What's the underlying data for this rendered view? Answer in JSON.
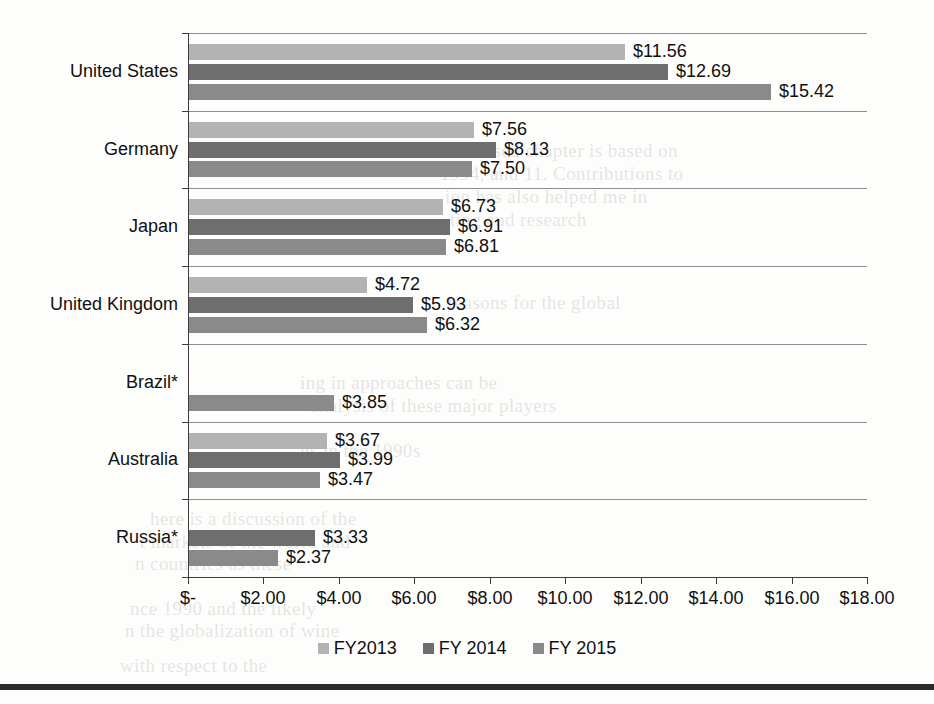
{
  "chart_data": {
    "type": "bar",
    "orientation": "horizontal",
    "title": "",
    "xlabel": "",
    "ylabel": "",
    "xlim": [
      0,
      18
    ],
    "xticks": [
      0,
      2,
      4,
      6,
      8,
      10,
      12,
      14,
      16,
      18
    ],
    "xtick_labels": [
      "$-",
      "$2.00",
      "$4.00",
      "$6.00",
      "$8.00",
      "$10.00",
      "$12.00",
      "$14.00",
      "$16.00",
      "$18.00"
    ],
    "grid": "horizontal-category-separators",
    "legend_position": "bottom-center",
    "categories": [
      "United States",
      "Germany",
      "Japan",
      "United Kingdom",
      "Brazil*",
      "Australia",
      "Russia*"
    ],
    "series": [
      {
        "name": "FY2013",
        "color": "#b3b3b3",
        "values": [
          11.56,
          7.56,
          6.73,
          4.72,
          null,
          3.67,
          null
        ],
        "labels": [
          "$11.56",
          "$7.56",
          "$6.73",
          "$4.72",
          "",
          "$3.67",
          ""
        ]
      },
      {
        "name": "FY 2014",
        "color": "#6e6e6e",
        "values": [
          12.69,
          8.13,
          6.91,
          5.93,
          null,
          3.99,
          3.33
        ],
        "labels": [
          "$12.69",
          "$8.13",
          "$6.91",
          "$5.93",
          "",
          "$3.99",
          "$3.33"
        ]
      },
      {
        "name": "FY 2015",
        "color": "#8a8a8a",
        "values": [
          15.42,
          7.5,
          6.81,
          6.32,
          3.85,
          3.47,
          2.37
        ],
        "labels": [
          "$15.42",
          "$7.50",
          "$6.81",
          "$6.32",
          "$3.85",
          "$3.47",
          "$2.37"
        ]
      }
    ]
  },
  "legend": {
    "items": [
      {
        "label": "FY2013",
        "color": "#b3b3b3"
      },
      {
        "label": "FY 2014",
        "color": "#6e6e6e"
      },
      {
        "label": "FY 2015",
        "color": "#8a8a8a"
      }
    ]
  },
  "background_text": [
    {
      "text": "is used chapter is based on",
      "x": 465,
      "y": 140
    },
    {
      "text": "1994, and 11. Contributions to",
      "x": 440,
      "y": 163
    },
    {
      "text": "ion has also helped me in",
      "x": 445,
      "y": 186
    },
    {
      "text": "ting and research",
      "x": 450,
      "y": 209
    },
    {
      "text": "reasons for the global",
      "x": 448,
      "y": 292
    },
    {
      "text": "ing in approaches can be",
      "x": 300,
      "y": 372
    },
    {
      "text": "analysis of these major players",
      "x": 310,
      "y": 395
    },
    {
      "text": "ns in the 1990s",
      "x": 300,
      "y": 440
    },
    {
      "text": "here is a discussion of the",
      "x": 150,
      "y": 508
    },
    {
      "text": "t markets of the world and",
      "x": 140,
      "y": 531
    },
    {
      "text": "n countries as these",
      "x": 135,
      "y": 553
    },
    {
      "text": "nce 1990 and the likely",
      "x": 130,
      "y": 598
    },
    {
      "text": "n the globalization of wine",
      "x": 125,
      "y": 620
    },
    {
      "text": "with respect to the",
      "x": 120,
      "y": 655
    }
  ]
}
